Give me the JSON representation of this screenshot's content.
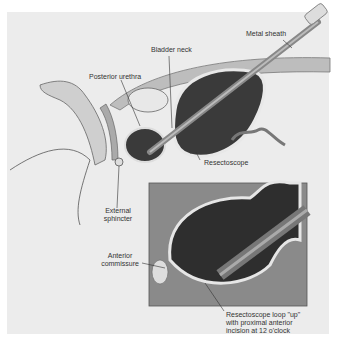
{
  "figure": {
    "labels": {
      "metal_sheath": "Metal sheath",
      "bladder_neck": "Bladder neck",
      "posterior_urethra": "Posterior urethra",
      "resectoscope": "Resectoscope",
      "external_sphincter_1": "External",
      "external_sphincter_2": "sphincter",
      "anterior_commissure_1": "Anterior",
      "anterior_commissure_2": "commissure",
      "loop_1": "Resectoscope loop \"up\"",
      "loop_2": "with proximal anterior",
      "loop_3": "incision at 12 o'clock"
    },
    "colors": {
      "background": "#ececec",
      "dark_cavity": "#3a3a3a",
      "tissue": "#c8c8c8",
      "inset_bg": "#8a8a8a"
    }
  }
}
